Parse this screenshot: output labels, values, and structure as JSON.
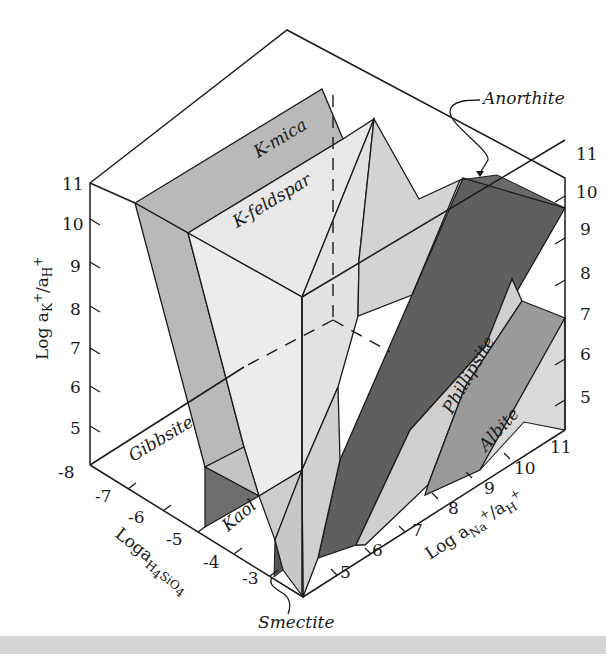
{
  "figure": {
    "type": "3D phase stability diagram",
    "colors": {
      "background": "#ffffff",
      "line": "#1a1a1a",
      "light_gray": "#e4e4e4",
      "mid_gray": "#b9b9b9",
      "medium_gray": "#9a9a9a",
      "dark_gray": "#5f5f5f",
      "white_face": "#f7f7f7"
    },
    "axes": {
      "vertical": {
        "label_main": "Log a",
        "label_sub1": "K",
        "label_sup1": "+",
        "label_mid": "/a",
        "label_sub2": "H",
        "label_sup2": "+",
        "left_ticks": [
          "11",
          "10",
          "9",
          "8",
          "7",
          "6",
          "5"
        ],
        "right_ticks": [
          "11",
          "10",
          "9",
          "8",
          "7",
          "6",
          "5"
        ]
      },
      "silica": {
        "label_main": "Loga",
        "label_sub": "H",
        "label_sub2": "4",
        "label_sub3": "SiO",
        "label_sub4": "4",
        "ticks": [
          "-8",
          "-7",
          "-6",
          "-5",
          "-4",
          "-3"
        ]
      },
      "sodium": {
        "label_main": "Log a",
        "label_sub1": "Na",
        "label_sup1": "+",
        "label_mid": "/a",
        "label_sub2": "H",
        "label_sup2": "+",
        "ticks": [
          "5",
          "6",
          "7",
          "8",
          "9",
          "10",
          "11"
        ]
      }
    },
    "minerals": {
      "k_mica": "K-mica",
      "k_feldspar": "K-feldspar",
      "anorthite": "Anorthite",
      "gibbsite": "Gibbsite",
      "kaol": "Kaol",
      "smectite": "Smectite",
      "phillipsite": "Phillipsite",
      "albite": "Albite"
    }
  }
}
